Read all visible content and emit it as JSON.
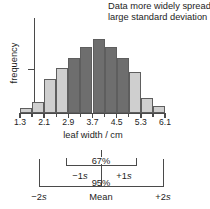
{
  "figure": {
    "caption_line1": "Data more widely spread:",
    "caption_line2": "large standard deviation",
    "y_axis_label": "frequency",
    "x_axis_title": "leaf width / cm"
  },
  "chart_data": {
    "type": "bar",
    "title": "Data more widely spread: large standard deviation",
    "xlabel": "leaf width / cm",
    "ylabel": "frequency",
    "grid": false,
    "legend": "none",
    "bin_edges": [
      1.3,
      1.7,
      2.1,
      2.5,
      2.9,
      3.3,
      3.7,
      4.1,
      4.5,
      4.9,
      5.3,
      5.7,
      6.1
    ],
    "tick_labels": [
      "1.3",
      "2.1",
      "2.9",
      "3.7",
      "4.5",
      "5.3",
      "6.1"
    ],
    "tick_values": [
      1.3,
      2.1,
      2.9,
      3.7,
      4.5,
      5.3,
      6.1
    ],
    "categories": [
      "1.3-1.7",
      "1.7-2.1",
      "2.1-2.5",
      "2.5-2.9",
      "2.9-3.3",
      "3.3-3.7",
      "3.7-4.1",
      "4.1-4.5",
      "4.5-4.9",
      "4.9-5.3",
      "5.3-5.7",
      "5.7-6.1"
    ],
    "values": [
      5,
      12,
      38,
      50,
      62,
      74,
      83,
      74,
      62,
      46,
      16,
      8
    ],
    "ylim": [
      0,
      95
    ],
    "bar_shades": [
      "light",
      "light",
      "light",
      "light",
      "dark",
      "dark",
      "dark",
      "dark",
      "dark",
      "light",
      "light",
      "light"
    ],
    "colors": {
      "dark_bar": "#6e6e6e",
      "light_bar": "#cfcfcf",
      "white_bar": "#ffffff",
      "outline": "#5e5e5e",
      "axis": "#4a4a4a",
      "text": "#1d1d1d"
    }
  },
  "sd_diagram": {
    "inner_percent": "67%",
    "outer_percent": "95%",
    "minus_one_sd": "−1s",
    "plus_one_sd": "+1s",
    "minus_two_sd": "−2s",
    "plus_two_sd": "+2s",
    "mean_label": "Mean"
  }
}
